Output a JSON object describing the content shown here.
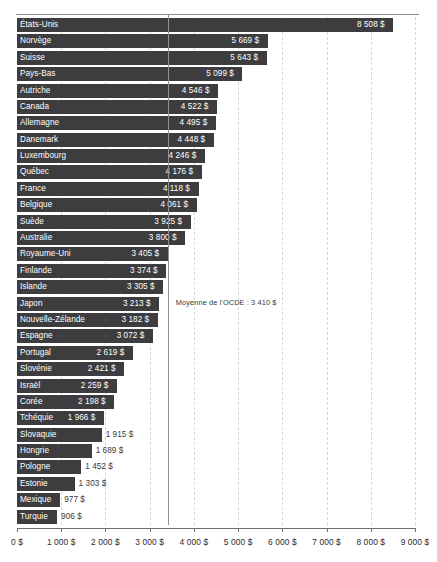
{
  "chart_data": {
    "type": "bar",
    "orientation": "horizontal",
    "title": "",
    "xlabel": "",
    "ylabel": "",
    "xlim": [
      0,
      9000
    ],
    "grid": true,
    "legend": null,
    "tick_labels": [
      "0 $",
      "1 000 $",
      "2 000 $",
      "3 000 $",
      "4 000 $",
      "5 000 $",
      "6 000 $",
      "7 000 $",
      "8 000 $",
      "9 000 $"
    ],
    "tick_values": [
      0,
      1000,
      2000,
      3000,
      4000,
      5000,
      6000,
      7000,
      8000,
      9000
    ],
    "annotation": {
      "label": "Moyenne de l'OCDE : 3 410 $",
      "value": 3410
    },
    "categories": [
      "États-Unis",
      "Norvège",
      "Suisse",
      "Pays-Bas",
      "Autriche",
      "Canada",
      "Allemagne",
      "Danemark",
      "Luxembourg",
      "Québec",
      "France",
      "Belgique",
      "Suède",
      "Australie",
      "Royaume-Uni",
      "Finlande",
      "Islande",
      "Japon",
      "Nouvelle-Zélande",
      "Espagne",
      "Portugal",
      "Slovénie",
      "Israël",
      "Corée",
      "Tchéquie",
      "Slovaquie",
      "Hongrie",
      "Pologne",
      "Estonie",
      "Mexique",
      "Turquie"
    ],
    "values": [
      8508,
      5669,
      5643,
      5099,
      4546,
      4522,
      4495,
      4448,
      4246,
      4176,
      4118,
      4061,
      3925,
      3800,
      3405,
      3374,
      3305,
      3213,
      3182,
      3072,
      2619,
      2421,
      2259,
      2198,
      1966,
      1915,
      1689,
      1452,
      1303,
      977,
      906
    ],
    "value_labels": [
      "8 508 $",
      "5 669 $",
      "5 643 $",
      "5 099 $",
      "4 546 $",
      "4 522 $",
      "4 495 $",
      "4 448 $",
      "4 246 $",
      "4 176 $",
      "4 118 $",
      "4 061 $",
      "3 925 $",
      "3 800 $",
      "3 405 $",
      "3 374 $",
      "3 305 $",
      "3 213 $",
      "3 182 $",
      "3 072 $",
      "2 619 $",
      "2 421 $",
      "2 259 $",
      "2 198 $",
      "1 966 $",
      "1 915 $",
      "1 689 $",
      "1 452 $",
      "1 303 $",
      "977 $",
      "906 $"
    ],
    "colors": {
      "bar": "#3d3d3f",
      "bar_label": "#ffffff",
      "outside_label": "#3a3a3c",
      "gridline": "#d8d8d8",
      "axis": "#6f6f6f",
      "background": "#ffffff"
    }
  }
}
